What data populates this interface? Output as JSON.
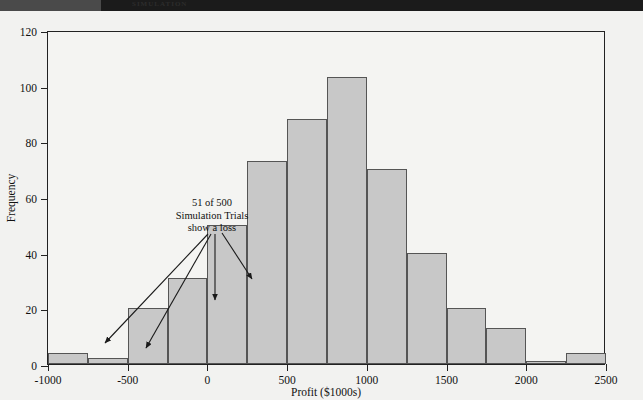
{
  "page": {
    "header_strip_text": "SIMULATION",
    "background_color": "#f2f2f0"
  },
  "chart_data": {
    "type": "bar",
    "title": "",
    "xlabel": "Profit ($1000s)",
    "ylabel": "Frequency",
    "xlim": [
      -1000,
      2500
    ],
    "ylim": [
      0,
      120
    ],
    "grid": false,
    "legend": null,
    "bin_width": 250,
    "bin_starts": [
      -1000,
      -750,
      -500,
      -250,
      0,
      250,
      500,
      750,
      1000,
      1250,
      1500,
      1750,
      2000,
      2250
    ],
    "categories": [
      "-1000 to -750",
      "-750 to -500",
      "-500 to -250",
      "-250 to 0",
      "0 to 250",
      "250 to 500",
      "500 to 750",
      "750 to 1000",
      "1000 to 1250",
      "1250 to 1500",
      "1500 to 1750",
      "1750 to 2000",
      "2000 to 2250",
      "2250 to 2500"
    ],
    "values": [
      4,
      2,
      20,
      31,
      50,
      73,
      88,
      103,
      70,
      40,
      20,
      13,
      1,
      4
    ],
    "xticks": [
      -1000,
      -500,
      0,
      500,
      1000,
      1500,
      2000,
      2500
    ],
    "xticklabels": [
      "-1000",
      "-500",
      "0",
      "500",
      "1000",
      "1500",
      "2000",
      "2500"
    ],
    "yticks": [
      0,
      20,
      40,
      60,
      80,
      100,
      120
    ],
    "yticklabels": [
      "0",
      "20",
      "40",
      "60",
      "80",
      "100",
      "120"
    ],
    "bar_fill_color": "#c8c8c8",
    "bar_edge_color": "#555555",
    "annotations": [
      {
        "text_lines": [
          "51 of 500",
          "Simulation Trials",
          "show a loss"
        ],
        "points_to_bins": [
          -1000,
          -750,
          -500,
          -250
        ],
        "note": "51 of 500 simulation trials show a loss"
      }
    ]
  }
}
